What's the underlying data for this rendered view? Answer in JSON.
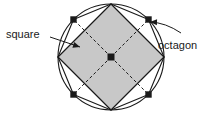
{
  "figure": {
    "background_color": "#ffffff",
    "stroke_color": "#1a1a1a",
    "square_fill_color": "#c8c8c8",
    "labels": {
      "square": "square",
      "octagon": "octagon"
    },
    "geometry": {
      "circle": {
        "cx": 111,
        "cy": 57,
        "r": 53
      },
      "square_vertices": [
        {
          "name": "top",
          "x": 111,
          "y": 4
        },
        {
          "name": "right",
          "x": 164,
          "y": 57
        },
        {
          "name": "bottom",
          "x": 111,
          "y": 110
        },
        {
          "name": "left",
          "x": 58,
          "y": 57
        }
      ],
      "octagon_vertices": [
        {
          "angle_deg": 270,
          "x": 111,
          "y": 4,
          "marked": false
        },
        {
          "angle_deg": 315,
          "x": 148.5,
          "y": 19.5,
          "marked": true
        },
        {
          "angle_deg": 0,
          "x": 164,
          "y": 57,
          "marked": false
        },
        {
          "angle_deg": 45,
          "x": 148.5,
          "y": 94.5,
          "marked": true
        },
        {
          "angle_deg": 90,
          "x": 111,
          "y": 110,
          "marked": false
        },
        {
          "angle_deg": 135,
          "x": 73.5,
          "y": 94.5,
          "marked": true
        },
        {
          "angle_deg": 180,
          "x": 58,
          "y": 57,
          "marked": false
        },
        {
          "angle_deg": 225,
          "x": 73.5,
          "y": 19.5,
          "marked": true
        }
      ],
      "center_point": {
        "x": 111,
        "y": 57
      },
      "dashed_radii_to": [
        {
          "x": 73.5,
          "y": 19.5
        },
        {
          "x": 148.5,
          "y": 19.5
        },
        {
          "x": 148.5,
          "y": 94.5
        },
        {
          "x": 73.5,
          "y": 94.5
        }
      ],
      "square_leader": {
        "x1": 50,
        "y1": 37,
        "x2": 80,
        "y2": 47
      },
      "octagon_leader": {
        "x1": 181,
        "y1": 33,
        "x2": 150,
        "y2": 22
      },
      "square_label_pos": {
        "x": 6,
        "y": 38
      },
      "octagon_label_pos": {
        "x": 158,
        "y": 49
      }
    }
  }
}
